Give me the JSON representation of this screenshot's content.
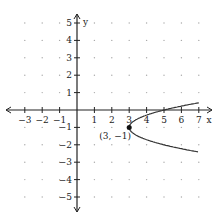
{
  "chart_data": {
    "type": "line",
    "title": "",
    "xlabel": "x",
    "ylabel": "y",
    "xlim": [
      -3.5,
      7.5
    ],
    "ylim": [
      -5.5,
      5.5
    ],
    "grid": "dots",
    "x_ticks": [
      -3,
      -2,
      -1,
      1,
      2,
      3,
      4,
      5,
      6,
      7
    ],
    "y_ticks": [
      5,
      4,
      3,
      2,
      1,
      -1,
      -2,
      -3,
      -4,
      -5
    ],
    "x_tick_labels": [
      "−3",
      "−2",
      "−1",
      "1",
      "2",
      "3",
      "4",
      "5",
      "6",
      "7"
    ],
    "y_tick_labels": [
      "5",
      "4",
      "3",
      "2",
      "1",
      "−1",
      "−2",
      "−3",
      "−4",
      "−5"
    ],
    "series": [
      {
        "name": "parabola",
        "equation": "x = 2(y + 1)^2 + 3",
        "points": [
          [
            7,
            0.41
          ],
          [
            5,
            0
          ],
          [
            4,
            -0.29
          ],
          [
            3.5,
            -0.5
          ],
          [
            3,
            -1
          ],
          [
            3.5,
            -1.5
          ],
          [
            4,
            -1.71
          ],
          [
            5,
            -2
          ],
          [
            7,
            -2.41
          ]
        ]
      }
    ],
    "annotations": [
      {
        "label": "(3, −1)",
        "x": 3,
        "y": -1,
        "marker": "dot"
      }
    ]
  }
}
